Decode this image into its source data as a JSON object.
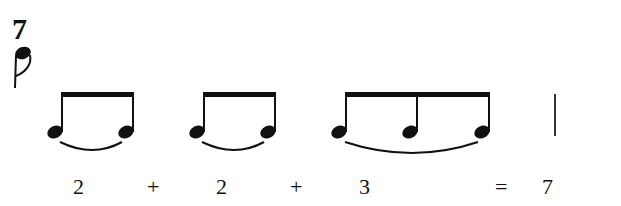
{
  "time_signature": {
    "numerator": "7",
    "denominator_symbol": "eighth-note"
  },
  "groups": [
    {
      "notes": 2,
      "label": "2"
    },
    {
      "notes": 2,
      "label": "2"
    },
    {
      "notes": 3,
      "label": "3"
    }
  ],
  "equation": {
    "terms": [
      "2",
      "+",
      "2",
      "+",
      "3"
    ],
    "equals": "=",
    "total": "7"
  },
  "barline": "single"
}
